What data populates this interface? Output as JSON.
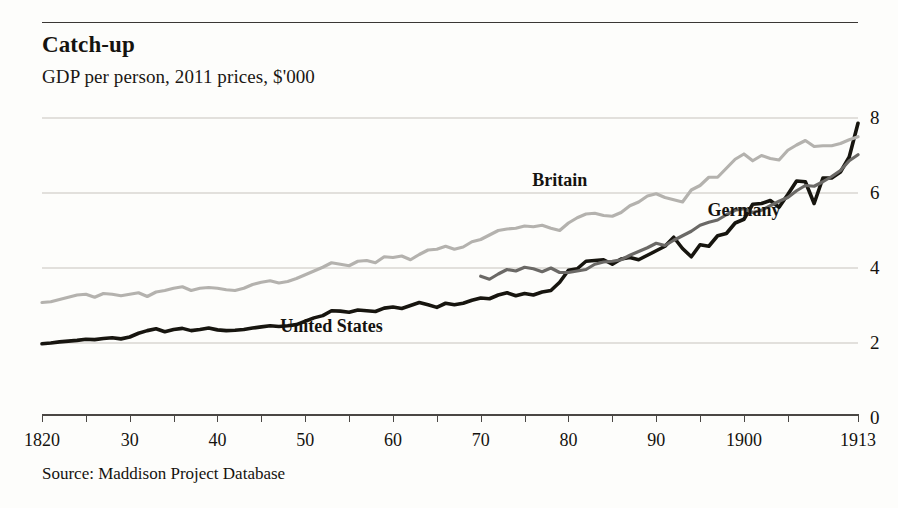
{
  "chart_data": {
    "type": "line",
    "title": "Catch-up",
    "subtitle": "GDP per person, 2011 prices, $'000",
    "source": "Source: Maddison Project Database",
    "xlabel": "",
    "ylabel": "",
    "xlim": [
      1820,
      1913
    ],
    "ylim": [
      0,
      8
    ],
    "grid": true,
    "legend_position": "inline-annotations",
    "y_ticks": [
      0,
      2,
      4,
      6,
      8
    ],
    "y_tick_labels": [
      "0",
      "2",
      "4",
      "6",
      "8"
    ],
    "x_ticks": [
      1820,
      1830,
      1840,
      1850,
      1860,
      1870,
      1880,
      1890,
      1900,
      1913
    ],
    "x_tick_labels": [
      "1820",
      "30",
      "40",
      "50",
      "60",
      "70",
      "80",
      "90",
      "1900",
      "1913"
    ],
    "colors": {
      "united_states": "#17150f",
      "britain": "#b4b2ae",
      "germany": "#6b6966",
      "gridline": "#d8d6d2",
      "axis": "#4a4744",
      "background": "#fdfdfb"
    },
    "series": [
      {
        "name": "United States",
        "color": "#17150f",
        "label_x": 1853,
        "label_y": 2.45,
        "x": [
          1820,
          1821,
          1822,
          1823,
          1824,
          1825,
          1826,
          1827,
          1828,
          1829,
          1830,
          1831,
          1832,
          1833,
          1834,
          1835,
          1836,
          1837,
          1838,
          1839,
          1840,
          1841,
          1842,
          1843,
          1844,
          1845,
          1846,
          1847,
          1848,
          1849,
          1850,
          1851,
          1852,
          1853,
          1854,
          1855,
          1856,
          1857,
          1858,
          1859,
          1860,
          1861,
          1862,
          1863,
          1864,
          1865,
          1866,
          1867,
          1868,
          1869,
          1870,
          1871,
          1872,
          1873,
          1874,
          1875,
          1876,
          1877,
          1878,
          1879,
          1880,
          1881,
          1882,
          1883,
          1884,
          1885,
          1886,
          1887,
          1888,
          1889,
          1890,
          1891,
          1892,
          1893,
          1894,
          1895,
          1896,
          1897,
          1898,
          1899,
          1900,
          1901,
          1902,
          1903,
          1904,
          1905,
          1906,
          1907,
          1908,
          1909,
          1910,
          1911,
          1912,
          1913
        ],
        "y": [
          1.98,
          2.0,
          2.03,
          2.05,
          2.07,
          2.1,
          2.09,
          2.12,
          2.14,
          2.11,
          2.16,
          2.26,
          2.33,
          2.38,
          2.3,
          2.36,
          2.39,
          2.33,
          2.36,
          2.4,
          2.35,
          2.33,
          2.34,
          2.36,
          2.4,
          2.43,
          2.46,
          2.44,
          2.46,
          2.49,
          2.58,
          2.67,
          2.73,
          2.86,
          2.85,
          2.82,
          2.88,
          2.86,
          2.84,
          2.93,
          2.96,
          2.92,
          3.0,
          3.08,
          3.02,
          2.95,
          3.06,
          3.02,
          3.06,
          3.14,
          3.2,
          3.18,
          3.28,
          3.34,
          3.26,
          3.32,
          3.28,
          3.36,
          3.4,
          3.62,
          3.94,
          3.98,
          4.18,
          4.2,
          4.22,
          4.1,
          4.24,
          4.28,
          4.22,
          4.34,
          4.46,
          4.58,
          4.82,
          4.52,
          4.3,
          4.62,
          4.58,
          4.86,
          4.92,
          5.2,
          5.3,
          5.7,
          5.72,
          5.8,
          5.62,
          5.96,
          6.32,
          6.3,
          5.72,
          6.4,
          6.4,
          6.56,
          6.96,
          7.86
        ]
      },
      {
        "name": "Britain",
        "color": "#b4b2ae",
        "label_x": 1879,
        "label_y": 6.35,
        "x": [
          1820,
          1821,
          1822,
          1823,
          1824,
          1825,
          1826,
          1827,
          1828,
          1829,
          1830,
          1831,
          1832,
          1833,
          1834,
          1835,
          1836,
          1837,
          1838,
          1839,
          1840,
          1841,
          1842,
          1843,
          1844,
          1845,
          1846,
          1847,
          1848,
          1849,
          1850,
          1851,
          1852,
          1853,
          1854,
          1855,
          1856,
          1857,
          1858,
          1859,
          1860,
          1861,
          1862,
          1863,
          1864,
          1865,
          1866,
          1867,
          1868,
          1869,
          1870,
          1871,
          1872,
          1873,
          1874,
          1875,
          1876,
          1877,
          1878,
          1879,
          1880,
          1881,
          1882,
          1883,
          1884,
          1885,
          1886,
          1887,
          1888,
          1889,
          1890,
          1891,
          1892,
          1893,
          1894,
          1895,
          1896,
          1897,
          1898,
          1899,
          1900,
          1901,
          1902,
          1903,
          1904,
          1905,
          1906,
          1907,
          1908,
          1909,
          1910,
          1911,
          1912,
          1913
        ],
        "y": [
          3.08,
          3.1,
          3.16,
          3.22,
          3.28,
          3.3,
          3.22,
          3.32,
          3.3,
          3.26,
          3.3,
          3.34,
          3.24,
          3.36,
          3.4,
          3.46,
          3.5,
          3.4,
          3.46,
          3.48,
          3.46,
          3.42,
          3.4,
          3.46,
          3.56,
          3.62,
          3.66,
          3.6,
          3.64,
          3.72,
          3.82,
          3.92,
          4.02,
          4.14,
          4.1,
          4.06,
          4.18,
          4.2,
          4.14,
          4.3,
          4.28,
          4.32,
          4.22,
          4.36,
          4.48,
          4.5,
          4.58,
          4.5,
          4.56,
          4.7,
          4.76,
          4.88,
          5.0,
          5.04,
          5.06,
          5.12,
          5.1,
          5.14,
          5.06,
          5.0,
          5.2,
          5.34,
          5.44,
          5.46,
          5.4,
          5.38,
          5.48,
          5.66,
          5.76,
          5.92,
          5.98,
          5.88,
          5.82,
          5.76,
          6.08,
          6.2,
          6.42,
          6.42,
          6.66,
          6.9,
          7.04,
          6.86,
          7.0,
          6.92,
          6.88,
          7.14,
          7.28,
          7.4,
          7.24,
          7.26,
          7.26,
          7.32,
          7.42,
          7.5
        ]
      },
      {
        "name": "Germany",
        "color": "#6b6966",
        "label_x": 1900,
        "label_y": 5.55,
        "x": [
          1870,
          1871,
          1872,
          1873,
          1874,
          1875,
          1876,
          1877,
          1878,
          1879,
          1880,
          1881,
          1882,
          1883,
          1884,
          1885,
          1886,
          1887,
          1888,
          1889,
          1890,
          1891,
          1892,
          1893,
          1894,
          1895,
          1896,
          1897,
          1898,
          1899,
          1900,
          1901,
          1902,
          1903,
          1904,
          1905,
          1906,
          1907,
          1908,
          1909,
          1910,
          1911,
          1912,
          1913
        ],
        "y": [
          3.78,
          3.7,
          3.84,
          3.96,
          3.92,
          4.02,
          3.98,
          3.9,
          4.0,
          3.88,
          3.88,
          3.92,
          3.96,
          4.1,
          4.16,
          4.18,
          4.22,
          4.34,
          4.44,
          4.54,
          4.66,
          4.6,
          4.74,
          4.86,
          4.98,
          5.14,
          5.22,
          5.28,
          5.42,
          5.54,
          5.58,
          5.48,
          5.54,
          5.66,
          5.78,
          5.88,
          6.06,
          6.2,
          6.18,
          6.3,
          6.44,
          6.6,
          6.86,
          7.02
        ]
      }
    ]
  }
}
